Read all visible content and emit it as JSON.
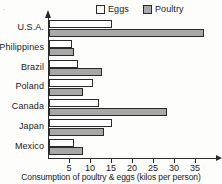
{
  "chart_data": {
    "type": "bar",
    "orientation": "horizontal",
    "title": "",
    "xlabel": "Consumption of poultry & eggs (kilos per person)",
    "ylabel": "",
    "categories": [
      "U.S.A.",
      "Philippines",
      "Brazil",
      "Poland",
      "Canada",
      "Japan",
      "Mexico"
    ],
    "series": [
      {
        "name": "Eggs",
        "color": "#ffffff",
        "values": [
          15,
          5.5,
          7,
          10.5,
          12,
          15,
          6
        ]
      },
      {
        "name": "Poultry",
        "color": "#a8a8a8",
        "values": [
          37,
          6,
          12.5,
          8,
          28,
          13,
          8
        ]
      }
    ],
    "xlim": [
      0,
      38
    ],
    "xticks": [
      5,
      10,
      15,
      20,
      25,
      30,
      35
    ],
    "xtick_labels": [
      "5",
      "10",
      "15",
      "20",
      "25",
      "30",
      "35"
    ],
    "grid": false,
    "legend_position": "top"
  },
  "legend": {
    "entries": [
      {
        "label": "Eggs",
        "swatch": "legend-swatch-eggs"
      },
      {
        "label": "Poultry",
        "swatch": "legend-swatch-poultry"
      }
    ]
  },
  "axis": {
    "x_title": "Consumption of poultry & eggs (kilos per person)"
  },
  "marks": {
    "corner": "."
  }
}
